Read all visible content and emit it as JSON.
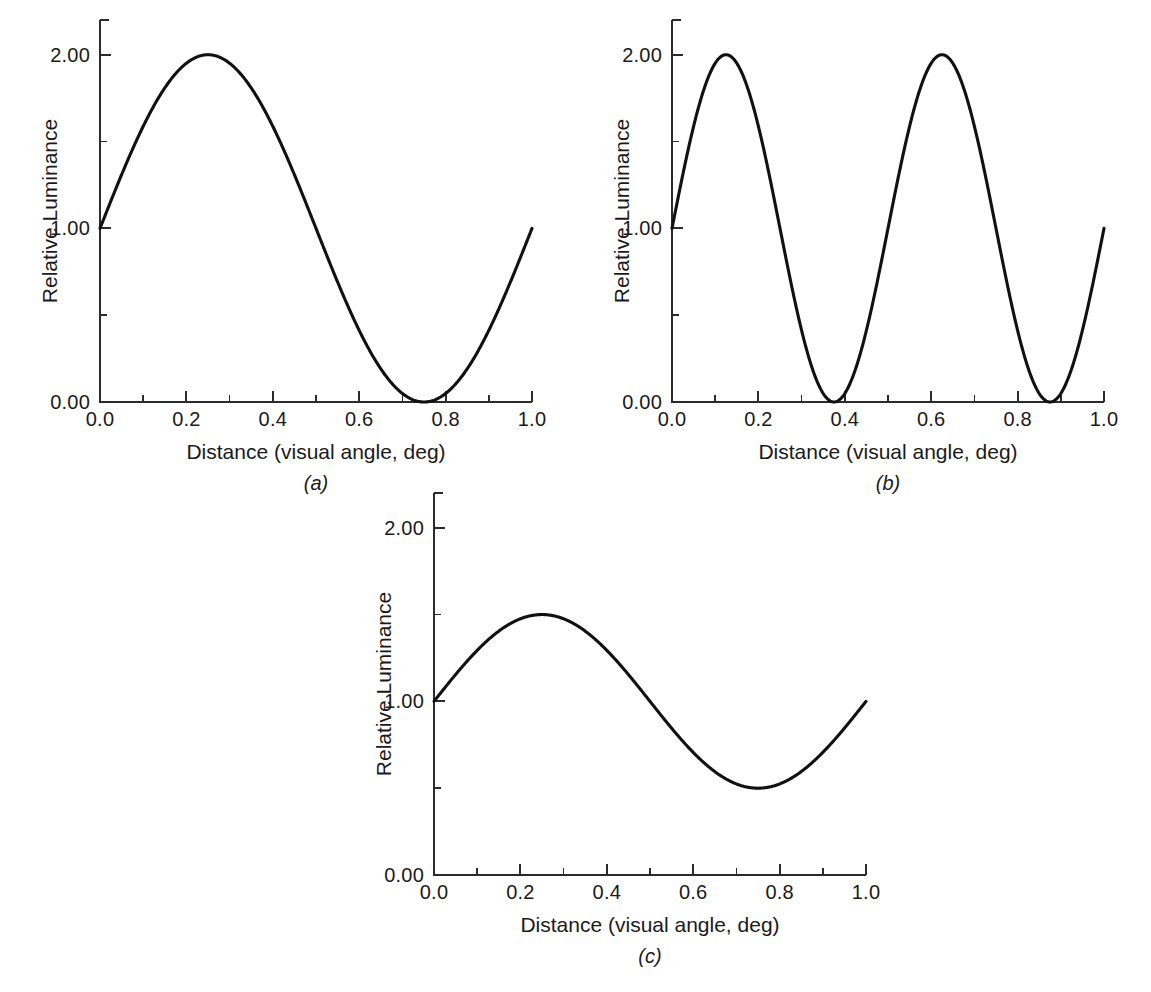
{
  "figure": {
    "panels": [
      {
        "letter": "(a)",
        "name": "panel-a",
        "box": {
          "left": 100,
          "top": 20,
          "width": 432,
          "height": 382
        },
        "y_axis_title": "Relative Luminance",
        "x_axis_title": "Distance (visual angle, deg)",
        "chart_data": {
          "type": "line",
          "title": "",
          "xlabel": "Distance (visual angle, deg)",
          "ylabel": "Relative Luminance",
          "xlim": [
            0.0,
            1.0
          ],
          "ylim": [
            0.0,
            2.2
          ],
          "grid": false,
          "legend": "none",
          "xticks": [
            0.0,
            0.2,
            0.4,
            0.6,
            0.8,
            1.0
          ],
          "xtick_labels": [
            "0.0",
            "0.2",
            "0.4",
            "0.6",
            "0.8",
            "1.0"
          ],
          "xticks_minor": [
            0.1,
            0.3,
            0.5,
            0.7,
            0.9
          ],
          "yticks": [
            0.0,
            1.0,
            2.0
          ],
          "ytick_labels": [
            "0.00",
            "1.00",
            "2.00"
          ],
          "yticks_minor": [
            0.5,
            1.5
          ],
          "waveform": {
            "mean": 1.0,
            "amplitude": 1.0,
            "cycles": 1,
            "phase_deg": 0
          },
          "peaks": [
            {
              "x": 0.25,
              "y": 2.0
            }
          ],
          "troughs": [
            {
              "x": 0.75,
              "y": 0.0
            }
          ],
          "endpoints": [
            {
              "x": 0.0,
              "y": 1.0
            },
            {
              "x": 1.0,
              "y": 1.0
            }
          ],
          "x": [
            0.0,
            0.05,
            0.1,
            0.15,
            0.2,
            0.25,
            0.3,
            0.35,
            0.4,
            0.45,
            0.5,
            0.55,
            0.6,
            0.65,
            0.7,
            0.75,
            0.8,
            0.85,
            0.9,
            0.95,
            1.0
          ],
          "y": [
            1.0,
            1.31,
            1.59,
            1.81,
            1.95,
            2.0,
            1.95,
            1.81,
            1.59,
            1.31,
            1.0,
            0.69,
            0.41,
            0.19,
            0.05,
            0.0,
            0.05,
            0.19,
            0.41,
            0.69,
            1.0
          ]
        }
      },
      {
        "letter": "(b)",
        "name": "panel-b",
        "box": {
          "left": 672,
          "top": 20,
          "width": 432,
          "height": 382
        },
        "y_axis_title": "Relative Luminance",
        "x_axis_title": "Distance (visual angle, deg)",
        "chart_data": {
          "type": "line",
          "title": "",
          "xlabel": "Distance (visual angle, deg)",
          "ylabel": "Relative Luminance",
          "xlim": [
            0.0,
            1.0
          ],
          "ylim": [
            0.0,
            2.2
          ],
          "grid": false,
          "legend": "none",
          "xticks": [
            0.0,
            0.2,
            0.4,
            0.6,
            0.8,
            1.0
          ],
          "xtick_labels": [
            "0.0",
            "0.2",
            "0.4",
            "0.6",
            "0.8",
            "1.0"
          ],
          "xticks_minor": [
            0.1,
            0.3,
            0.5,
            0.7,
            0.9
          ],
          "yticks": [
            0.0,
            1.0,
            2.0
          ],
          "ytick_labels": [
            "0.00",
            "1.00",
            "2.00"
          ],
          "yticks_minor": [
            0.5,
            1.5
          ],
          "waveform": {
            "mean": 1.0,
            "amplitude": 1.0,
            "cycles": 2,
            "phase_deg": 0
          },
          "peaks": [
            {
              "x": 0.125,
              "y": 2.0
            },
            {
              "x": 0.625,
              "y": 2.0
            }
          ],
          "troughs": [
            {
              "x": 0.375,
              "y": 0.0
            },
            {
              "x": 0.875,
              "y": 0.0
            }
          ],
          "endpoints": [
            {
              "x": 0.0,
              "y": 1.0
            },
            {
              "x": 1.0,
              "y": 1.0
            }
          ],
          "x": [
            0.0,
            0.05,
            0.1,
            0.125,
            0.15,
            0.2,
            0.25,
            0.3,
            0.35,
            0.375,
            0.4,
            0.45,
            0.5,
            0.55,
            0.6,
            0.625,
            0.65,
            0.7,
            0.75,
            0.8,
            0.85,
            0.875,
            0.9,
            0.95,
            1.0
          ],
          "y": [
            1.0,
            1.59,
            1.95,
            2.0,
            1.95,
            1.59,
            1.0,
            0.41,
            0.05,
            0.0,
            0.05,
            0.41,
            1.0,
            1.59,
            1.95,
            2.0,
            1.95,
            1.59,
            1.0,
            0.41,
            0.05,
            0.0,
            0.05,
            0.41,
            1.0
          ]
        }
      },
      {
        "letter": "(c)",
        "name": "panel-c",
        "box": {
          "left": 434,
          "top": 493,
          "width": 432,
          "height": 382
        },
        "y_axis_title": "Relative Luminance",
        "x_axis_title": "Distance (visual angle, deg)",
        "chart_data": {
          "type": "line",
          "title": "",
          "xlabel": "Distance (visual angle, deg)",
          "ylabel": "Relative Luminance",
          "xlim": [
            0.0,
            1.0
          ],
          "ylim": [
            0.0,
            2.2
          ],
          "grid": false,
          "legend": "none",
          "xticks": [
            0.0,
            0.2,
            0.4,
            0.6,
            0.8,
            1.0
          ],
          "xtick_labels": [
            "0.0",
            "0.2",
            "0.4",
            "0.6",
            "0.8",
            "1.0"
          ],
          "xticks_minor": [
            0.1,
            0.3,
            0.5,
            0.7,
            0.9
          ],
          "yticks": [
            0.0,
            1.0,
            2.0
          ],
          "ytick_labels": [
            "0.00",
            "1.00",
            "2.00"
          ],
          "yticks_minor": [
            0.5,
            1.5
          ],
          "waveform": {
            "mean": 1.0,
            "amplitude": 0.5,
            "cycles": 1,
            "phase_deg": 0
          },
          "peaks": [
            {
              "x": 0.25,
              "y": 1.5
            }
          ],
          "troughs": [
            {
              "x": 0.75,
              "y": 0.5
            }
          ],
          "endpoints": [
            {
              "x": 0.0,
              "y": 1.0
            },
            {
              "x": 1.0,
              "y": 1.0
            }
          ],
          "x": [
            0.0,
            0.05,
            0.1,
            0.15,
            0.2,
            0.25,
            0.3,
            0.35,
            0.4,
            0.45,
            0.5,
            0.55,
            0.6,
            0.65,
            0.7,
            0.75,
            0.8,
            0.85,
            0.9,
            0.95,
            1.0
          ],
          "y": [
            1.0,
            1.15,
            1.29,
            1.4,
            1.48,
            1.5,
            1.48,
            1.4,
            1.29,
            1.15,
            1.0,
            0.85,
            0.71,
            0.6,
            0.52,
            0.5,
            0.52,
            0.6,
            0.71,
            0.85,
            1.0
          ]
        }
      }
    ],
    "caption": ""
  }
}
